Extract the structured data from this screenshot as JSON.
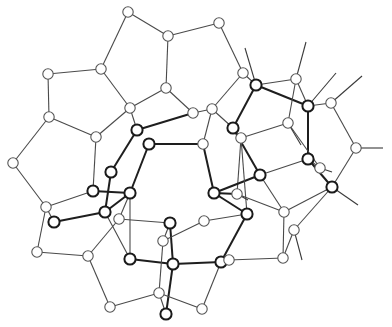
{
  "figure": {
    "type": "ball-and-stick structural diagram",
    "colors": {
      "background": "#ffffff",
      "thin_stroke": "#555555",
      "thick_stroke": "#1a1a1a"
    }
  },
  "atoms": [
    {
      "id": "a1",
      "x": 128,
      "y": 12,
      "style": "thin"
    },
    {
      "id": "a2",
      "x": 168,
      "y": 36,
      "style": "thin"
    },
    {
      "id": "a3",
      "x": 219,
      "y": 23,
      "style": "thin"
    },
    {
      "id": "a4",
      "x": 101,
      "y": 69,
      "style": "thin"
    },
    {
      "id": "a5",
      "x": 48,
      "y": 74,
      "style": "thin"
    },
    {
      "id": "a6",
      "x": 166,
      "y": 88,
      "style": "thin"
    },
    {
      "id": "a7",
      "x": 243,
      "y": 73,
      "style": "thin"
    },
    {
      "id": "a8",
      "x": 256,
      "y": 85,
      "style": "thick"
    },
    {
      "id": "a9",
      "x": 296,
      "y": 79,
      "style": "thin"
    },
    {
      "id": "a10",
      "x": 49,
      "y": 117,
      "style": "thin"
    },
    {
      "id": "a11",
      "x": 130,
      "y": 108,
      "style": "thin"
    },
    {
      "id": "a12",
      "x": 193,
      "y": 113,
      "style": "thin"
    },
    {
      "id": "a13",
      "x": 212,
      "y": 109,
      "style": "thin"
    },
    {
      "id": "a14",
      "x": 308,
      "y": 106,
      "style": "thick"
    },
    {
      "id": "a15",
      "x": 331,
      "y": 103,
      "style": "thin"
    },
    {
      "id": "a16",
      "x": 96,
      "y": 137,
      "style": "thin"
    },
    {
      "id": "a17",
      "x": 137,
      "y": 130,
      "style": "thick"
    },
    {
      "id": "a18",
      "x": 149,
      "y": 144,
      "style": "thick"
    },
    {
      "id": "a19",
      "x": 233,
      "y": 128,
      "style": "thick"
    },
    {
      "id": "a20",
      "x": 288,
      "y": 123,
      "style": "thin"
    },
    {
      "id": "a21",
      "x": 203,
      "y": 144,
      "style": "thin"
    },
    {
      "id": "a22",
      "x": 241,
      "y": 138,
      "style": "thin"
    },
    {
      "id": "a23",
      "x": 356,
      "y": 148,
      "style": "thin"
    },
    {
      "id": "a24",
      "x": 308,
      "y": 159,
      "style": "thick"
    },
    {
      "id": "a25",
      "x": 320,
      "y": 168,
      "style": "thin"
    },
    {
      "id": "a26",
      "x": 13,
      "y": 163,
      "style": "thin"
    },
    {
      "id": "a27",
      "x": 111,
      "y": 172,
      "style": "thick"
    },
    {
      "id": "a28",
      "x": 260,
      "y": 175,
      "style": "thick"
    },
    {
      "id": "a29",
      "x": 332,
      "y": 187,
      "style": "thick"
    },
    {
      "id": "a30",
      "x": 93,
      "y": 191,
      "style": "thick"
    },
    {
      "id": "a31",
      "x": 130,
      "y": 193,
      "style": "thick"
    },
    {
      "id": "a32",
      "x": 214,
      "y": 193,
      "style": "thick"
    },
    {
      "id": "a33",
      "x": 237,
      "y": 194,
      "style": "thin"
    },
    {
      "id": "a34",
      "x": 46,
      "y": 207,
      "style": "thin"
    },
    {
      "id": "a35",
      "x": 105,
      "y": 212,
      "style": "thick"
    },
    {
      "id": "a36",
      "x": 247,
      "y": 214,
      "style": "thick"
    },
    {
      "id": "a37",
      "x": 284,
      "y": 212,
      "style": "thin"
    },
    {
      "id": "a38",
      "x": 54,
      "y": 222,
      "style": "thick"
    },
    {
      "id": "a39",
      "x": 119,
      "y": 219,
      "style": "thin"
    },
    {
      "id": "a40",
      "x": 170,
      "y": 223,
      "style": "thick"
    },
    {
      "id": "a41",
      "x": 204,
      "y": 221,
      "style": "thin"
    },
    {
      "id": "a42",
      "x": 294,
      "y": 230,
      "style": "thin"
    },
    {
      "id": "a43",
      "x": 163,
      "y": 241,
      "style": "thin"
    },
    {
      "id": "a44",
      "x": 37,
      "y": 252,
      "style": "thin"
    },
    {
      "id": "a45",
      "x": 88,
      "y": 256,
      "style": "thin"
    },
    {
      "id": "a46",
      "x": 130,
      "y": 259,
      "style": "thick"
    },
    {
      "id": "a47",
      "x": 173,
      "y": 264,
      "style": "thick"
    },
    {
      "id": "a48",
      "x": 221,
      "y": 262,
      "style": "thick"
    },
    {
      "id": "a49",
      "x": 229,
      "y": 260,
      "style": "thin"
    },
    {
      "id": "a50",
      "x": 283,
      "y": 258,
      "style": "thin"
    },
    {
      "id": "a51",
      "x": 159,
      "y": 293,
      "style": "thin"
    },
    {
      "id": "a52",
      "x": 110,
      "y": 307,
      "style": "thin"
    },
    {
      "id": "a53",
      "x": 202,
      "y": 309,
      "style": "thin"
    },
    {
      "id": "a54",
      "x": 166,
      "y": 314,
      "style": "thick"
    }
  ],
  "bonds": [
    [
      "a1",
      "a2",
      "thin"
    ],
    [
      "a1",
      "a4",
      "thin"
    ],
    [
      "a2",
      "a3",
      "thin"
    ],
    [
      "a2",
      "a6",
      "thin"
    ],
    [
      "a3",
      "a7",
      "thin"
    ],
    [
      "a4",
      "a5",
      "thin"
    ],
    [
      "a4",
      "a11",
      "thin"
    ],
    [
      "a5",
      "a10",
      "thin"
    ],
    [
      "a6",
      "a11",
      "thin"
    ],
    [
      "a6",
      "a12",
      "thin"
    ],
    [
      "a7",
      "a8",
      "thin"
    ],
    [
      "a7",
      "a13",
      "thin"
    ],
    [
      "a8",
      "a9",
      "thin"
    ],
    [
      "a8",
      "a14",
      "thick"
    ],
    [
      "a8",
      "a19",
      "thick"
    ],
    [
      "a9",
      "a14",
      "thin"
    ],
    [
      "a10",
      "a16",
      "thin"
    ],
    [
      "a10",
      "a26",
      "thin"
    ],
    [
      "a11",
      "a17",
      "thin"
    ],
    [
      "a11",
      "a16",
      "thin"
    ],
    [
      "a12",
      "a13",
      "thin"
    ],
    [
      "a12",
      "a17",
      "thick"
    ],
    [
      "a13",
      "a19",
      "thin"
    ],
    [
      "a13",
      "a21",
      "thin"
    ],
    [
      "a14",
      "a15",
      "thin"
    ],
    [
      "a14",
      "a24",
      "thick"
    ],
    [
      "a15",
      "a23",
      "thin"
    ],
    [
      "a16",
      "a30",
      "thin"
    ],
    [
      "a17",
      "a27",
      "thick"
    ],
    [
      "a18",
      "a21",
      "thick"
    ],
    [
      "a18",
      "a31",
      "thick"
    ],
    [
      "a19",
      "a22",
      "thin"
    ],
    [
      "a19",
      "a28",
      "thick"
    ],
    [
      "a20",
      "a22",
      "thin"
    ],
    [
      "a20",
      "a9",
      "thin"
    ],
    [
      "a20",
      "a25",
      "thin"
    ],
    [
      "a21",
      "a32",
      "thick"
    ],
    [
      "a22",
      "a33",
      "thin"
    ],
    [
      "a23",
      "a29",
      "thin"
    ],
    [
      "a24",
      "a29",
      "thick"
    ],
    [
      "a24",
      "a28",
      "thin"
    ],
    [
      "a24",
      "a25",
      "thin"
    ],
    [
      "a26",
      "a34",
      "thin"
    ],
    [
      "a27",
      "a35",
      "thick"
    ],
    [
      "a30",
      "a31",
      "thick"
    ],
    [
      "a30",
      "a34",
      "thin"
    ],
    [
      "a31",
      "a35",
      "thick"
    ],
    [
      "a31",
      "a39",
      "thin"
    ],
    [
      "a28",
      "a32",
      "thick"
    ],
    [
      "a32",
      "a33",
      "thick"
    ],
    [
      "a32",
      "a36",
      "thick"
    ],
    [
      "a33",
      "a37",
      "thin"
    ],
    [
      "a28",
      "a37",
      "thin"
    ],
    [
      "a29",
      "a37",
      "thin"
    ],
    [
      "a29",
      "a42",
      "thin"
    ],
    [
      "a34",
      "a38",
      "thin"
    ],
    [
      "a38",
      "a35",
      "thick"
    ],
    [
      "a35",
      "a46",
      "thin"
    ],
    [
      "a34",
      "a44",
      "thin"
    ],
    [
      "a44",
      "a45",
      "thin"
    ],
    [
      "a45",
      "a39",
      "thin"
    ],
    [
      "a45",
      "a52",
      "thin"
    ],
    [
      "a39",
      "a40",
      "thin"
    ],
    [
      "a40",
      "a47",
      "thick"
    ],
    [
      "a40",
      "a43",
      "thin"
    ],
    [
      "a43",
      "a41",
      "thin"
    ],
    [
      "a41",
      "a36",
      "thin"
    ],
    [
      "a36",
      "a48",
      "thick"
    ],
    [
      "a46",
      "a47",
      "thick"
    ],
    [
      "a47",
      "a48",
      "thick"
    ],
    [
      "a48",
      "a49",
      "thin"
    ],
    [
      "a49",
      "a50",
      "thin"
    ],
    [
      "a37",
      "a50",
      "thin"
    ],
    [
      "a42",
      "a50",
      "thin"
    ],
    [
      "a48",
      "a53",
      "thin"
    ],
    [
      "a52",
      "a51",
      "thin"
    ],
    [
      "a51",
      "a54",
      "thin"
    ],
    [
      "a47",
      "a54",
      "thick"
    ],
    [
      "a51",
      "a53",
      "thin"
    ],
    [
      "a43",
      "a51",
      "thin"
    ],
    [
      "a46",
      "a31",
      "thin"
    ],
    [
      "a22",
      "a36",
      "thin"
    ]
  ],
  "stubs": [
    [
      "a8",
      245,
      48
    ],
    [
      "a9",
      306,
      42
    ],
    [
      "a14",
      336,
      73
    ],
    [
      "a15",
      362,
      76
    ],
    [
      "a23",
      383,
      148
    ],
    [
      "a29",
      358,
      205
    ],
    [
      "a42",
      302,
      260
    ],
    [
      "a20",
      301,
      145
    ],
    [
      "a25",
      332,
      172
    ],
    [
      "a33",
      248,
      200
    ]
  ]
}
